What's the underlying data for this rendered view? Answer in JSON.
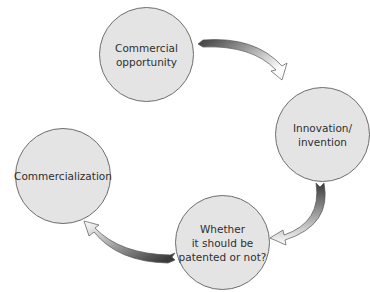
{
  "diagram": {
    "type": "cycle",
    "nodes": [
      {
        "id": "commercial-opportunity",
        "label": "Commercial\nopportunity"
      },
      {
        "id": "innovation-invention",
        "label": "Innovation/\ninvention"
      },
      {
        "id": "patent-decision",
        "label": "Whether\nit should be\npatented or not?"
      },
      {
        "id": "commercialization",
        "label": "Commercialization"
      }
    ],
    "edges": [
      {
        "from": "commercial-opportunity",
        "to": "innovation-invention"
      },
      {
        "from": "innovation-invention",
        "to": "patent-decision"
      },
      {
        "from": "patent-decision",
        "to": "commercialization"
      }
    ],
    "colors": {
      "node_fill": "#e4e4e4",
      "node_border": "#6e6e6e",
      "text": "#2f2f2f",
      "arrow_dark": "#3a3a3a",
      "arrow_light": "#ffffff"
    }
  }
}
